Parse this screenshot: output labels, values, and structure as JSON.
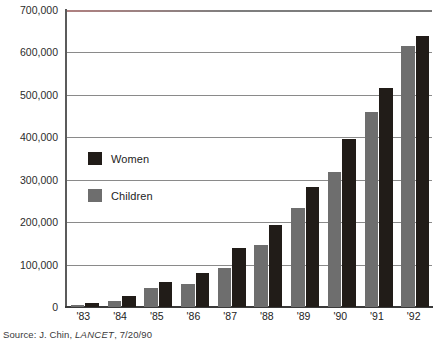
{
  "chart_data": {
    "type": "bar",
    "title": "",
    "xlabel": "",
    "ylabel": "",
    "categories": [
      "'83",
      "'84",
      "'85",
      "'86",
      "'87",
      "'88",
      "'89",
      "'90",
      "'91",
      "'92"
    ],
    "series": [
      {
        "name": "Children",
        "color": "#6e6e6e",
        "values": [
          5000,
          14000,
          45000,
          54000,
          92000,
          146000,
          234000,
          318000,
          460000,
          615000
        ]
      },
      {
        "name": "Women",
        "color": "#211c18",
        "values": [
          9000,
          25000,
          59000,
          80000,
          139000,
          193000,
          283000,
          396000,
          517000,
          640000
        ]
      }
    ],
    "ylim": [
      0,
      700000
    ],
    "yticks": [
      0,
      100000,
      200000,
      300000,
      400000,
      500000,
      600000,
      700000
    ],
    "ytick_labels": [
      "0",
      "100,000",
      "200,000",
      "300,000",
      "400,000",
      "500,000",
      "600,000",
      "700,000"
    ],
    "grid": true,
    "legend_position": "inside-upper-left"
  },
  "legend": {
    "entries": [
      {
        "label": "Women",
        "color": "#211c18"
      },
      {
        "label": "Children",
        "color": "#6e6e6e"
      }
    ]
  },
  "source": {
    "prefix": "Source: J. Chin, ",
    "publication": "LANCET",
    "suffix": ", 7/20/90"
  }
}
